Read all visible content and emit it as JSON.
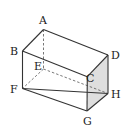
{
  "diagram": {
    "type": "rectangular-prism",
    "vertices": {
      "A": {
        "x": 43.5,
        "y": 29.5,
        "label": "A",
        "lx": 39,
        "ly": 24
      },
      "B": {
        "x": 22.5,
        "y": 51,
        "label": "B",
        "lx": 10,
        "ly": 55
      },
      "C": {
        "x": 87.3,
        "y": 76.7,
        "label": "C",
        "lx": 86,
        "ly": 82
      },
      "D": {
        "x": 108,
        "y": 55,
        "label": "D",
        "lx": 111,
        "ly": 59
      },
      "E": {
        "x": 43.5,
        "y": 69,
        "label": "E",
        "lx": 34,
        "ly": 70
      },
      "F": {
        "x": 22.5,
        "y": 88.5,
        "label": "F",
        "lx": 10,
        "ly": 93
      },
      "G": {
        "x": 87,
        "y": 111,
        "label": "G",
        "lx": 83,
        "ly": 125
      },
      "H": {
        "x": 108,
        "y": 93.5,
        "label": "H",
        "lx": 111,
        "ly": 98
      }
    },
    "solid_edges": [
      [
        "A",
        "B"
      ],
      [
        "A",
        "D"
      ],
      [
        "B",
        "C"
      ],
      [
        "C",
        "D"
      ],
      [
        "B",
        "F"
      ],
      [
        "F",
        "G"
      ],
      [
        "C",
        "G"
      ],
      [
        "D",
        "H"
      ],
      [
        "G",
        "H"
      ],
      [
        "F",
        "H"
      ]
    ],
    "dashed_edges": [
      [
        "A",
        "E"
      ],
      [
        "E",
        "F"
      ],
      [
        "E",
        "H"
      ]
    ],
    "shaded_face": [
      "C",
      "D",
      "H",
      "G"
    ],
    "colors": {
      "line": "#333333",
      "shade": "#dedede",
      "dashed": "#555555"
    }
  }
}
